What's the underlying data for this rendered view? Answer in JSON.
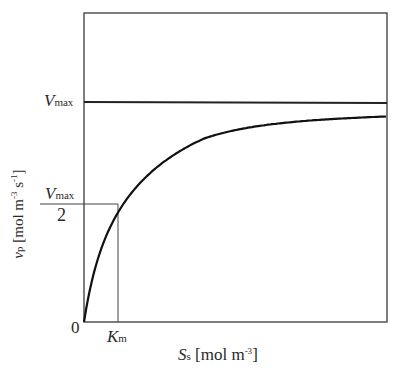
{
  "chart_data": {
    "type": "line",
    "title": "",
    "xlabel": "S_s [mol m^-3]",
    "ylabel": "v_p [mol m^-3 s^-1]",
    "x_ticks": [
      "0",
      "K_m"
    ],
    "y_ticks": [
      "0",
      "V_max/2",
      "V_max"
    ],
    "grid": false,
    "legend": null,
    "series": [
      {
        "name": "Michaelis-Menten rate",
        "equation": "v_p = V_max * S_s / (K_m + S_s)",
        "x_in_Km_units": [
          0,
          0.5,
          1,
          2,
          3,
          5,
          9
        ],
        "y_fraction_of_Vmax": [
          0,
          0.333,
          0.5,
          0.667,
          0.75,
          0.833,
          0.9
        ]
      },
      {
        "name": "V_max asymptote",
        "type": "hline",
        "y_fraction_of_Vmax": 1.0
      }
    ],
    "annotations": [
      {
        "text": "V_max/2 at S_s = K_m",
        "type": "guide-lines"
      }
    ]
  },
  "labels": {
    "vmax_sym": "V",
    "vmax_sub": "max",
    "half_denom": "2",
    "zero": "0",
    "km_sym": "K",
    "km_sub": "m",
    "x_sym": "S",
    "x_sub": "s",
    "x_unit": "[mol m",
    "x_unit_sup": "-3",
    "x_unit_close": "]",
    "y_sym": "v",
    "y_sub": "p",
    "y_unit": "[mol m",
    "y_unit_sup1": "-3",
    "y_unit_mid": " s",
    "y_unit_sup2": "-1",
    "y_unit_close": "]"
  }
}
